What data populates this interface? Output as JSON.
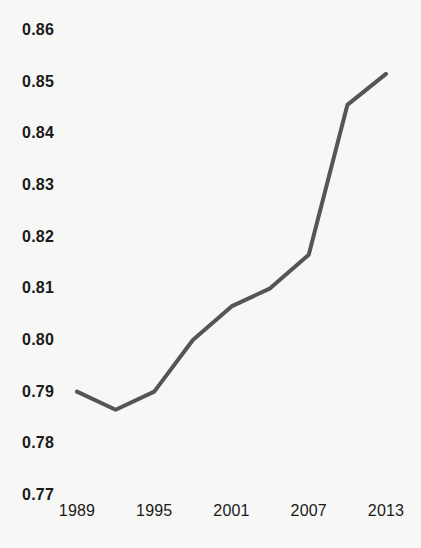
{
  "chart_data": {
    "type": "line",
    "title": "",
    "subtitle": "",
    "xlabel": "",
    "ylabel": "",
    "x": [
      1989,
      1992,
      1995,
      1998,
      2001,
      2004,
      2007,
      2010,
      2013
    ],
    "values": [
      0.79,
      0.7865,
      0.79,
      0.8,
      0.8065,
      0.81,
      0.8165,
      0.8455,
      0.8515
    ],
    "series": [
      {
        "name": "",
        "values": [
          0.79,
          0.7865,
          0.79,
          0.8,
          0.8065,
          0.81,
          0.8165,
          0.8455,
          0.8515
        ]
      }
    ],
    "xlim": [
      1989,
      2013
    ],
    "ylim": [
      0.77,
      0.86
    ],
    "y_ticks": [
      0.86,
      0.85,
      0.84,
      0.83,
      0.82,
      0.81,
      0.8,
      0.79,
      0.78,
      0.77
    ],
    "y_tick_labels": [
      "0.86",
      "0.85",
      "0.84",
      "0.83",
      "0.82",
      "0.81",
      "0.80",
      "0.79",
      "0.78",
      "0.77"
    ],
    "x_ticks": [
      1989,
      1995,
      2001,
      2007,
      2013
    ],
    "x_tick_labels": [
      "1989",
      "1995",
      "2001",
      "2007",
      "2013"
    ],
    "grid": false,
    "legend": "none",
    "annotations": []
  },
  "style": {
    "line_color": "#555555",
    "background_color": "#f7f7f5",
    "text_color": "#1a1a1a",
    "line_width": 4
  }
}
